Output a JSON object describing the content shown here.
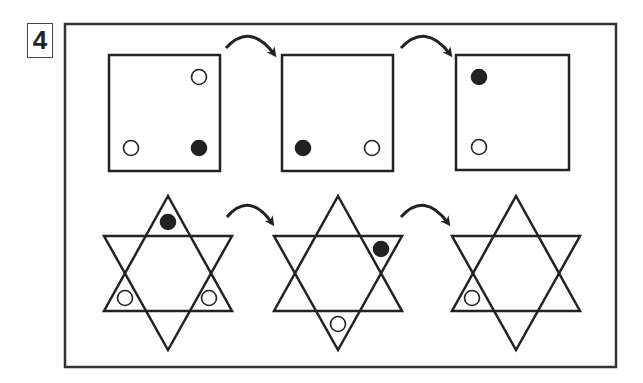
{
  "puzzle": {
    "number_label": "4",
    "colors": {
      "stroke": "#222222",
      "filled_dot": "#222222",
      "hollow_dot": "#ffffff",
      "frame": "#333333"
    },
    "frame": {
      "x": 65,
      "y": 24,
      "w": 551,
      "h": 343
    },
    "rows": [
      {
        "shape": "square",
        "panels": [
          {
            "box": [
              109,
              55,
              111,
              116
            ],
            "dots": [
              {
                "x": 199,
                "y": 77,
                "filled": false
              },
              {
                "x": 131,
                "y": 148,
                "filled": false
              },
              {
                "x": 199,
                "y": 148,
                "filled": true
              }
            ]
          },
          {
            "box": [
              282,
              55,
              111,
              116
            ],
            "dots": [
              {
                "x": 303,
                "y": 148,
                "filled": true
              },
              {
                "x": 372,
                "y": 148,
                "filled": false
              }
            ]
          },
          {
            "box": [
              456,
              55,
              113,
              115
            ],
            "dots": [
              {
                "x": 479,
                "y": 77,
                "filled": true
              },
              {
                "x": 479,
                "y": 147,
                "filled": false
              }
            ]
          }
        ],
        "arrows": [
          {
            "from": [
              226,
              48
            ],
            "to": [
              274,
              54
            ]
          },
          {
            "from": [
              401,
              48
            ],
            "to": [
              450,
              54
            ]
          }
        ]
      },
      {
        "shape": "hexagram",
        "panels": [
          {
            "center": [
              168,
              273
            ],
            "dots": [
              {
                "x": 168,
                "y": 222,
                "filled": true
              },
              {
                "x": 125,
                "y": 298,
                "filled": false
              },
              {
                "x": 209,
                "y": 298,
                "filled": false
              }
            ]
          },
          {
            "center": [
              338,
              273
            ],
            "dots": [
              {
                "x": 381,
                "y": 249,
                "filled": true
              },
              {
                "x": 338,
                "y": 324,
                "filled": false
              }
            ]
          },
          {
            "center": [
              516,
              273
            ],
            "dots": [
              {
                "x": 472,
                "y": 298,
                "filled": false
              }
            ]
          }
        ],
        "arrows": [
          {
            "from": [
              227,
              217
            ],
            "to": [
              272,
              223
            ]
          },
          {
            "from": [
              401,
              217
            ],
            "to": [
              448,
              223
            ]
          }
        ]
      }
    ]
  }
}
